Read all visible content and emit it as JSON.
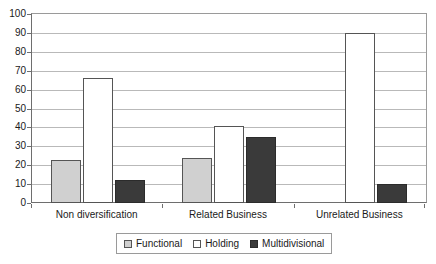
{
  "chart_data": {
    "type": "bar",
    "title": "",
    "xlabel": "",
    "ylabel": "",
    "ylim": [
      0,
      100
    ],
    "ytick_step": 10,
    "yticks": [
      100,
      90,
      80,
      70,
      60,
      50,
      40,
      30,
      20,
      10,
      0
    ],
    "grid": true,
    "legend_position": "bottom",
    "categories": [
      "Non diversification",
      "Related Business",
      "Unrelated Business"
    ],
    "series": [
      {
        "name": "Functional",
        "color": "#d0d0d0",
        "values": [
          23,
          24,
          null
        ]
      },
      {
        "name": "Holding",
        "color": "#ffffff",
        "values": [
          66,
          41,
          90
        ]
      },
      {
        "name": "Multidivisional",
        "color": "#3a3a3a",
        "values": [
          12,
          35,
          10
        ]
      }
    ]
  },
  "axis": {
    "y_labels": [
      "100",
      "90",
      "80",
      "70",
      "60",
      "50",
      "40",
      "30",
      "20",
      "10",
      "0"
    ],
    "x_labels": [
      "Non diversification",
      "Related Business",
      "Unrelated Business"
    ]
  },
  "legend": {
    "items": [
      {
        "label": "Functional",
        "swatch": "functional"
      },
      {
        "label": "Holding",
        "swatch": "holding"
      },
      {
        "label": "Multidivisional",
        "swatch": "multidivisional"
      }
    ]
  },
  "colors": {
    "functional": "#d0d0d0",
    "holding": "#ffffff",
    "multidivisional": "#3a3a3a",
    "grid": "#b9b9b9",
    "axis": "#6e6e6e",
    "text": "#1a1a1a"
  }
}
